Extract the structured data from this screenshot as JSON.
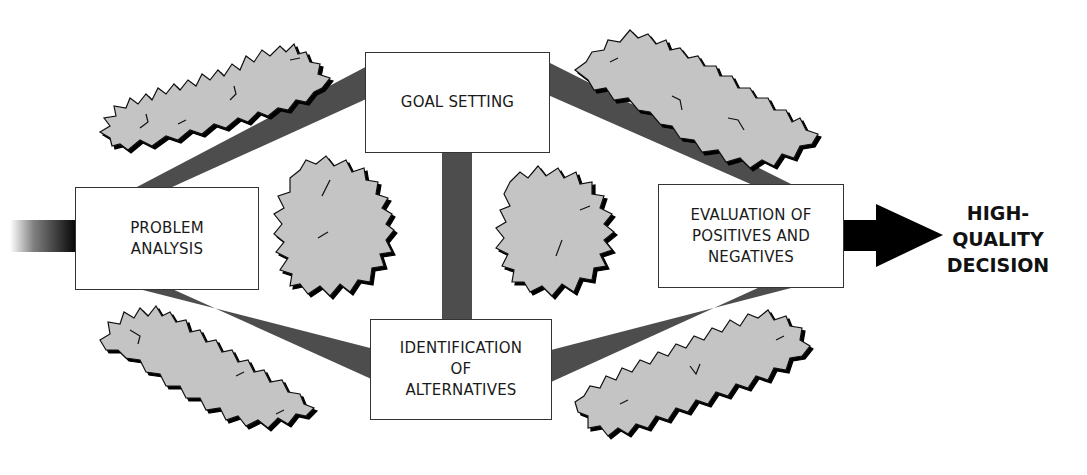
{
  "diagram": {
    "boxes": {
      "problem_analysis": {
        "lines": [
          "PROBLEM",
          "ANALYSIS"
        ]
      },
      "goal_setting": {
        "lines": [
          "GOAL SETTING"
        ]
      },
      "identification": {
        "lines": [
          "IDENTIFICATION",
          "OF",
          "ALTERNATIVES"
        ]
      },
      "evaluation": {
        "lines": [
          "EVALUATION OF",
          "POSITIVES AND",
          "NEGATIVES"
        ]
      }
    },
    "outcome": {
      "lines": [
        "HIGH-",
        "QUALITY",
        "DECISION"
      ]
    },
    "connectors": [
      {
        "from": "problem_analysis",
        "to": "goal_setting"
      },
      {
        "from": "problem_analysis",
        "to": "identification"
      },
      {
        "from": "goal_setting",
        "to": "identification"
      },
      {
        "from": "goal_setting",
        "to": "evaluation"
      },
      {
        "from": "identification",
        "to": "evaluation"
      },
      {
        "from": "evaluation",
        "to": "outcome"
      }
    ],
    "obstacles": [
      "shrub-top-left",
      "shrub-top-right",
      "shrub-center-left",
      "shrub-center-right",
      "shrub-bottom-left",
      "shrub-bottom-right"
    ],
    "colors": {
      "band": "#4d4d4d",
      "shrub_fill": "#c4c4c4",
      "shrub_outline": "#111111",
      "arrow": "#000000",
      "box_border": "#333333",
      "text": "#1a1a1a"
    }
  }
}
